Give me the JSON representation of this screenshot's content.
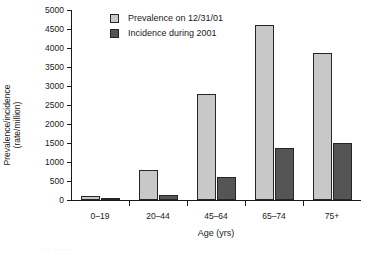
{
  "chart_data": {
    "type": "bar",
    "title": "",
    "xlabel": "Age (yrs)",
    "ylabel_line1": "Prevalence/incidence",
    "ylabel_line2": "(rate/million)",
    "categories": [
      "0–19",
      "20–44",
      "45–64",
      "65–74",
      "75+"
    ],
    "series": [
      {
        "name": "Prevalence on 12/31/01",
        "color": "#c8c8c8",
        "values": [
          100,
          780,
          2800,
          4600,
          3880
        ]
      },
      {
        "name": "Incidence during 2001",
        "color": "#555555",
        "values": [
          60,
          130,
          600,
          1370,
          1500
        ]
      }
    ],
    "ylim": [
      0,
      5000
    ],
    "ytick_values": [
      0,
      500,
      1000,
      1500,
      2000,
      2500,
      3000,
      3500,
      4000,
      4500,
      5000
    ],
    "ytick_labels": [
      "0",
      "500",
      "1000",
      "1500",
      "2000",
      "2500",
      "3000",
      "3500",
      "4000",
      "4500",
      "5000"
    ],
    "grid": false,
    "legend_position": "top-left-inside"
  },
  "legend": {
    "items": [
      {
        "label": "Prevalence on 12/31/01",
        "swatch": "light"
      },
      {
        "label": "Incidence during 2001",
        "swatch": "dark"
      }
    ]
  },
  "artifact": {
    "text": "·· ··· ··"
  }
}
